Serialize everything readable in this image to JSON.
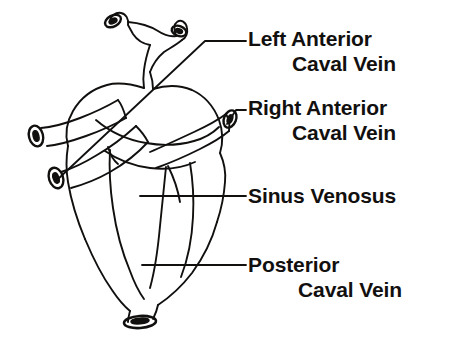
{
  "figure": {
    "kind": "anatomical-line-diagram",
    "background_color": "#ffffff",
    "ink_color": "#12100f",
    "width": 464,
    "height": 341
  },
  "labels": [
    {
      "id": "left-anterior-caval-vein",
      "line1": "Left Anterior",
      "line2": "Caval Vein",
      "leader": "diagonal-elbow",
      "points_to": "left anterior caval vein trunk (lower-left tube)"
    },
    {
      "id": "right-anterior-caval-vein",
      "line1": "Right Anterior",
      "line2": "Caval Vein",
      "leader": "short-elbow",
      "points_to": "right anterior caval vein opening (right tube)"
    },
    {
      "id": "sinus-venosus",
      "line1": "Sinus Venosus",
      "line2": "",
      "leader": "horizontal",
      "points_to": "sinus venosus chamber (mid body)"
    },
    {
      "id": "posterior-caval-vein",
      "line1": "Posterior",
      "line2": "Caval Vein",
      "leader": "horizontal",
      "points_to": "posterior caval vein (bottom tube)"
    }
  ],
  "structures": [
    {
      "name": "left-anterior-caval-vein",
      "type": "vessel-tube"
    },
    {
      "name": "right-anterior-caval-vein",
      "type": "vessel-tube"
    },
    {
      "name": "sinus-venosus",
      "type": "chamber"
    },
    {
      "name": "posterior-caval-vein",
      "type": "vessel-tube"
    },
    {
      "name": "pulmonary-trunk-bifurcation",
      "type": "vessel-branching"
    },
    {
      "name": "ventricle",
      "type": "chamber"
    },
    {
      "name": "atrium",
      "type": "chamber"
    }
  ]
}
